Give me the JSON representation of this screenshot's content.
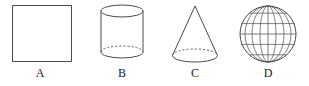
{
  "figure": {
    "background_color": "#ffffff",
    "stroke_color": "#4a4a4a",
    "width": 309,
    "height": 86,
    "items": [
      {
        "label": "A",
        "shape": "square",
        "icon": "square-icon",
        "description": "Plane square outline",
        "bounds": {
          "x": 12,
          "y": 5,
          "width": 60,
          "height": 57
        },
        "hidden_edges": "none"
      },
      {
        "label": "B",
        "shape": "cylinder",
        "icon": "cylinder-icon",
        "description": "Right circular cylinder with visible top ellipse and dashed hidden base edge",
        "bounds": {
          "x": 101,
          "y": 5,
          "width": 43,
          "height": 58
        },
        "hidden_edges": "dashed-back-base-arc"
      },
      {
        "label": "C",
        "shape": "cone",
        "icon": "cone-icon",
        "description": "Right circular cone with apex on top and dashed hidden base arc",
        "bounds": {
          "x": 172,
          "y": 6,
          "width": 46,
          "height": 57
        },
        "hidden_edges": "dashed-back-base-arc"
      },
      {
        "label": "D",
        "shape": "sphere",
        "icon": "sphere-icon",
        "description": "Sphere drawn as a globe with meridian and latitude grid lines",
        "bounds": {
          "x": 240,
          "y": 6,
          "width": 56,
          "height": 56
        },
        "meridian_count": 7,
        "latitude_count": 5,
        "hidden_edges": "none"
      }
    ]
  }
}
